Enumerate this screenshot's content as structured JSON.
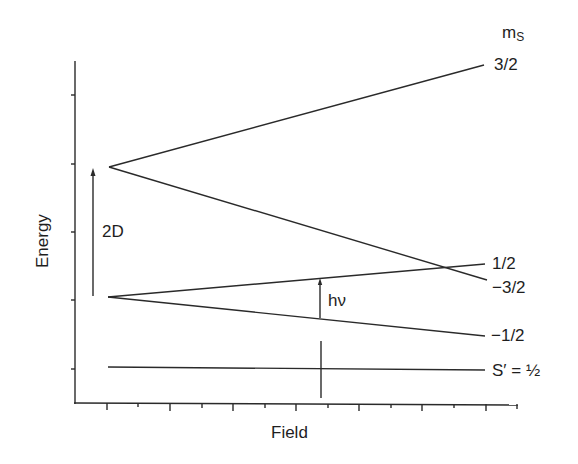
{
  "diagram": {
    "x_axis_label": "Field",
    "y_axis_label": "Energy",
    "ms_header": "m",
    "ms_header_sub": "S",
    "levels": [
      {
        "label": "3/2"
      },
      {
        "label": "1/2"
      },
      {
        "label": "−3/2"
      },
      {
        "label": "−1/2"
      },
      {
        "label": "S′ = ½"
      }
    ],
    "zero_field_splitting_label": "2D",
    "transition_label": "hν",
    "colors": {
      "line": "#2a2a2a",
      "background": "#ffffff"
    }
  }
}
